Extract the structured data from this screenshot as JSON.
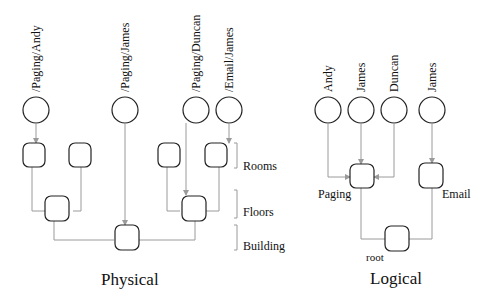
{
  "physical": {
    "title": "Physical",
    "subscribers": [
      {
        "label": "/Paging/Andy",
        "cx": 36
      },
      {
        "label": "/Paging/James",
        "cx": 125
      },
      {
        "label": "/Paging/Duncan",
        "cx": 196
      },
      {
        "label": "/Email/James",
        "cx": 229
      }
    ],
    "levels": {
      "rooms": "Rooms",
      "floors": "Floors",
      "building": "Building"
    }
  },
  "logical": {
    "title": "Logical",
    "subscribers": [
      {
        "label": "Andy",
        "cx": 328
      },
      {
        "label": "James",
        "cx": 361
      },
      {
        "label": "Duncan",
        "cx": 394
      },
      {
        "label": "James",
        "cx": 432
      }
    ],
    "nodes": {
      "paging": "Paging",
      "email": "Email",
      "root": "root"
    }
  },
  "colors": {
    "stroke": "#222222",
    "edge": "#9a9a9a",
    "background": "#ffffff"
  }
}
